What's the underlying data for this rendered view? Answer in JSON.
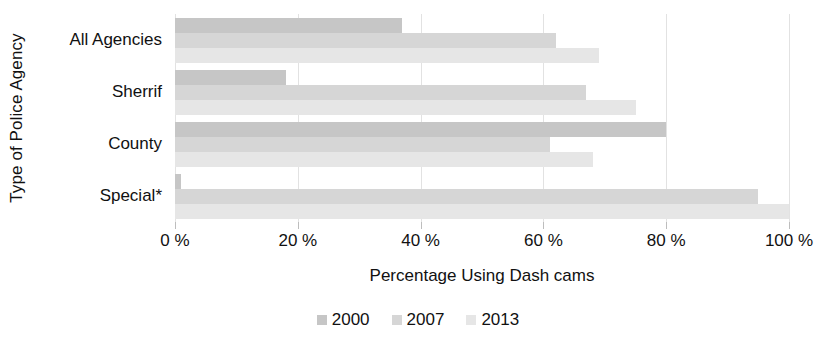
{
  "chart_data": {
    "type": "bar",
    "orientation": "horizontal",
    "title": "",
    "xlabel": "Percentage Using Dash cams",
    "ylabel": "Type of Police Agency",
    "categories": [
      "All Agencies",
      "Sherrif",
      "County",
      "Special*"
    ],
    "series": [
      {
        "name": "2000",
        "color": "#c6c6c6",
        "values": [
          37,
          18,
          80,
          1
        ]
      },
      {
        "name": "2007",
        "color": "#d6d6d6",
        "values": [
          62,
          67,
          61,
          95
        ]
      },
      {
        "name": "2013",
        "color": "#e6e6e6",
        "values": [
          69,
          75,
          68,
          100
        ]
      }
    ],
    "xlim": [
      0,
      100
    ],
    "xticks": [
      0,
      20,
      40,
      60,
      80,
      100
    ],
    "xticklabels": [
      "0 %",
      "20 %",
      "40 %",
      "60 %",
      "80 %",
      "100 %"
    ],
    "grid": true,
    "legend_position": "bottom"
  },
  "legend": {
    "items": [
      {
        "label": "2000"
      },
      {
        "label": "2007"
      },
      {
        "label": "2013"
      }
    ]
  }
}
